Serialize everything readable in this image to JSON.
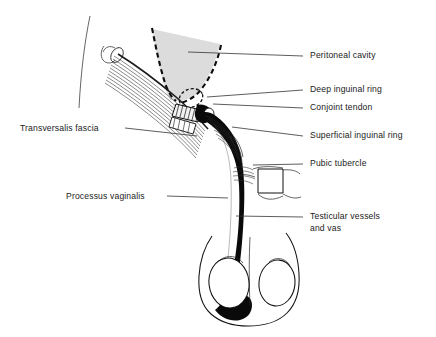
{
  "figure": {
    "domain": "anatomical-line-diagram",
    "background_color": "#ffffff",
    "ink_color": "#111111",
    "peritoneum_fill": "#dcdcdc",
    "cord_fill": "#0a0a0a"
  },
  "labels": [
    {
      "id": "peritoneal-cavity",
      "text": "Peritoneal cavity",
      "side": "right",
      "text_x": 310,
      "text_y": 58,
      "leader": {
        "x1": 188,
        "y1": 52,
        "x2": 303,
        "y2": 56
      }
    },
    {
      "id": "deep-inguinal-ring",
      "text": "Deep inguinal ring",
      "side": "right",
      "text_x": 310,
      "text_y": 92,
      "leader": {
        "x1": 207,
        "y1": 97,
        "x2": 303,
        "y2": 90
      }
    },
    {
      "id": "conjoint-tendon",
      "text": "Conjoint tendon",
      "side": "right",
      "text_x": 310,
      "text_y": 110,
      "leader": {
        "x1": 213,
        "y1": 104,
        "x2": 303,
        "y2": 108
      }
    },
    {
      "id": "superficial-inguinal-ring",
      "text": "Superficial inguinal ring",
      "side": "right",
      "text_x": 310,
      "text_y": 138,
      "leader": {
        "x1": 232,
        "y1": 127,
        "x2": 303,
        "y2": 136
      }
    },
    {
      "id": "pubic-tubercle",
      "text": "Pubic tubercle",
      "side": "right",
      "text_x": 310,
      "text_y": 166,
      "leader": {
        "x1": 253,
        "y1": 165,
        "x2": 303,
        "y2": 164
      }
    },
    {
      "id": "testicular-vessels-and-vas",
      "text": "Testicular vessels",
      "text_line2": "and vas",
      "side": "right",
      "text_x": 310,
      "text_y": 219,
      "text2_x": 310,
      "text2_y": 231,
      "leader": {
        "x1": 236,
        "y1": 216,
        "x2": 303,
        "y2": 217
      }
    },
    {
      "id": "transversalis-fascia",
      "text": "Transversalis fascia",
      "side": "left",
      "text_x": 20,
      "text_y": 131,
      "leader": {
        "x1": 125,
        "y1": 128,
        "x2": 197,
        "y2": 136
      }
    },
    {
      "id": "processus-vaginalis",
      "text": "Processus vaginalis",
      "side": "left",
      "text_x": 66,
      "text_y": 199,
      "leader": {
        "x1": 167,
        "y1": 196,
        "x2": 228,
        "y2": 198
      }
    }
  ]
}
